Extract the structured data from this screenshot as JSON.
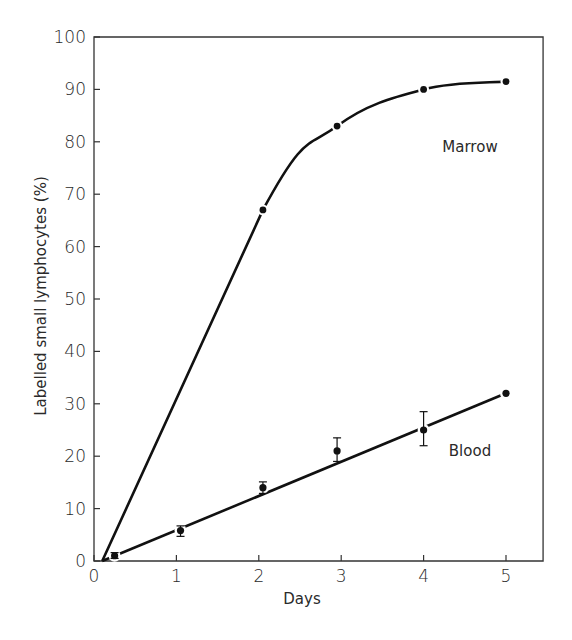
{
  "chart_data": {
    "type": "line",
    "title": "",
    "xlabel": "Days",
    "ylabel": "Labelled small lymphocytes (%)",
    "xlim": [
      0,
      5.45
    ],
    "ylim": [
      0,
      100
    ],
    "x_ticks": [
      0,
      1,
      2,
      3,
      4,
      5
    ],
    "x_tick_labels": [
      "0",
      "1",
      "2",
      "3",
      "4",
      "5"
    ],
    "y_ticks": [
      0,
      10,
      20,
      30,
      40,
      50,
      60,
      70,
      80,
      90,
      100
    ],
    "y_tick_labels": [
      "0",
      "10",
      "20",
      "30",
      "40",
      "50",
      "60",
      "70",
      "80",
      "90",
      "100"
    ],
    "grid": false,
    "legend": "inline labels",
    "series": [
      {
        "name": "Marrow",
        "label_position": {
          "x": 4.55,
          "y": 84
        },
        "line_start": {
          "x": 0.1,
          "y": 0
        },
        "points": [
          {
            "x": 2.05,
            "y": 67
          },
          {
            "x": 2.95,
            "y": 83
          },
          {
            "x": 4.0,
            "y": 90
          },
          {
            "x": 5.0,
            "y": 91.5
          }
        ]
      },
      {
        "name": "Blood",
        "label_position": {
          "x": 4.55,
          "y": 21
        },
        "line_start": {
          "x": 0.1,
          "y": 0
        },
        "points": [
          {
            "x": 0.25,
            "y": 1,
            "err_low": 0.5,
            "err_high": 1.6
          },
          {
            "x": 1.05,
            "y": 5.8,
            "err_low": 4.7,
            "err_high": 6.7
          },
          {
            "x": 2.05,
            "y": 14,
            "err_low": 12.9,
            "err_high": 15.1
          },
          {
            "x": 2.95,
            "y": 21,
            "err_low": 19,
            "err_high": 23.5
          },
          {
            "x": 4.0,
            "y": 25,
            "err_low": 22,
            "err_high": 28.5
          },
          {
            "x": 5.0,
            "y": 32
          }
        ]
      }
    ]
  },
  "labels": {
    "xlabel": "Days",
    "ylabel": "Labelled small lymphocytes (%)",
    "marrow": "Marrow",
    "blood": "Blood"
  },
  "colors": {
    "line": "#111111",
    "axis": "#333333",
    "text": "#2a2a2a",
    "background": "#ffffff"
  }
}
